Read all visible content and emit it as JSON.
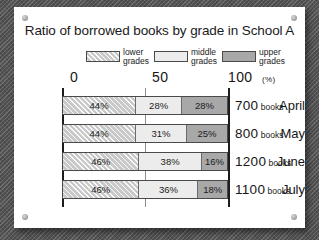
{
  "chart_data": {
    "type": "bar",
    "orientation": "horizontal",
    "stacked": true,
    "title": "Ratio of borrowed books by grade in School A",
    "xlabel": "(%)",
    "ylabel": "",
    "xlim": [
      0,
      100
    ],
    "xticks": [
      "0",
      "50",
      "100"
    ],
    "unit_label": "(%)",
    "grid": false,
    "legend_position": "top",
    "categories": [
      "April",
      "May",
      "June",
      "July"
    ],
    "series": [
      {
        "name": "lower grades",
        "values": [
          44,
          44,
          46,
          46
        ],
        "swatch": "hatched"
      },
      {
        "name": "middle grades",
        "values": [
          28,
          31,
          38,
          36
        ],
        "swatch": "light"
      },
      {
        "name": "upper grades",
        "values": [
          28,
          25,
          16,
          18
        ],
        "swatch": "dark"
      }
    ],
    "value_labels": [
      [
        "44%",
        "28%",
        "28%"
      ],
      [
        "44%",
        "31%",
        "25%"
      ],
      [
        "46%",
        "38%",
        "16%"
      ],
      [
        "46%",
        "36%",
        "18%"
      ]
    ],
    "row_totals": [
      "700",
      "800",
      "1200",
      "1100"
    ],
    "row_total_unit": "books",
    "annotations": [
      "700 books",
      "800 books",
      "1200 books",
      "1100 books"
    ]
  },
  "chart": {
    "title": "Ratio of borrowed books by grade in School A",
    "legend": [
      {
        "label_line1": "lower",
        "label_line2": "grades"
      },
      {
        "label_line1": "middle",
        "label_line2": "grades"
      },
      {
        "label_line1": "upper",
        "label_line2": "grades"
      }
    ],
    "axis": {
      "tick_0": "0",
      "tick_50": "50",
      "tick_100": "100",
      "percent": "(%)"
    },
    "rows": [
      {
        "month": "April",
        "segments": [
          {
            "value": "44%"
          },
          {
            "value": "28%"
          },
          {
            "value": "28%"
          }
        ],
        "total": "700",
        "unit": "books"
      },
      {
        "month": "May",
        "segments": [
          {
            "value": "44%"
          },
          {
            "value": "31%"
          },
          {
            "value": "25%"
          }
        ],
        "total": "800",
        "unit": "books"
      },
      {
        "month": "June",
        "segments": [
          {
            "value": "46%"
          },
          {
            "value": "38%"
          },
          {
            "value": "16%"
          }
        ],
        "total": "1200",
        "unit": "books"
      },
      {
        "month": "July",
        "segments": [
          {
            "value": "46%"
          },
          {
            "value": "36%"
          },
          {
            "value": "18%"
          }
        ],
        "total": "1100",
        "unit": "books"
      }
    ]
  },
  "colors": {
    "lower_grades": "#c9c9c9",
    "middle_grades": "#ececec",
    "upper_grades": "#a8a8a8",
    "card": "#ffffff",
    "backdrop": "#5a5a5a",
    "ink": "#161616"
  }
}
